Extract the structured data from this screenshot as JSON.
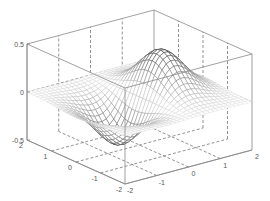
{
  "chart_data": {
    "type": "surface-mesh",
    "title": "",
    "function": "z = x * exp(-x^2 - y^2)",
    "xlabel": "",
    "ylabel": "",
    "zlabel": "",
    "x_range": [
      -2,
      2
    ],
    "y_range": [
      -2,
      2
    ],
    "z_range": [
      -0.5,
      0.5
    ],
    "grid_steps": 30,
    "x_ticks": [
      -2,
      -1,
      0,
      1,
      2
    ],
    "y_ticks": [
      -2,
      -1,
      0,
      1,
      2
    ],
    "z_ticks": [
      -0.5,
      0,
      0.5
    ],
    "x_tick_labels": [
      "-2",
      "-1",
      "0",
      "1",
      "2"
    ],
    "y_tick_labels": [
      "-2",
      "-1",
      "0",
      "1",
      "2"
    ],
    "z_tick_labels": [
      "-0.5",
      "0",
      "0.5"
    ],
    "peak": {
      "x": 0.707,
      "y": 0,
      "z": 0.429
    },
    "trough": {
      "x": -0.707,
      "y": 0,
      "z": -0.429
    },
    "grid": true,
    "box": true,
    "colors": {
      "axis": "#888888",
      "grid_dashed": "#777777",
      "mesh_high": "#333333",
      "mesh_low": "#e4e4e4",
      "tick_text": "#555555"
    }
  },
  "projection": {
    "origin": [
      125,
      184
    ],
    "ex": [
      31.75,
      -8.5
    ],
    "ey": [
      -24.5,
      -11
    ],
    "ez": [
      0,
      -96
    ]
  }
}
